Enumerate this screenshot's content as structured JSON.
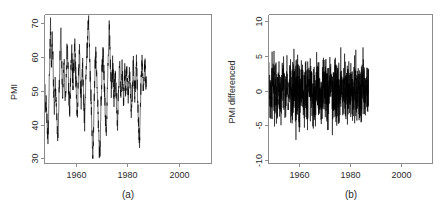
{
  "figure": {
    "background_color": "#ffffff",
    "line_color": "#000000",
    "axis_color": "#8c8c8c",
    "panels": [
      {
        "id": "a",
        "caption": "(a)",
        "ylabel": "PMI",
        "xlabel": ""
      },
      {
        "id": "b",
        "caption": "(b)",
        "ylabel": "PMI differenced",
        "xlabel": ""
      }
    ]
  },
  "chart_data": [
    {
      "type": "line",
      "panel": "a",
      "title": "",
      "caption": "(a)",
      "xlabel": "",
      "ylabel": "PMI",
      "xlim": [
        1948.0,
        2012.5
      ],
      "ylim": [
        28.5,
        72.5
      ],
      "xticks": [
        1960,
        1980,
        2000
      ],
      "xticklabels": [
        "1960",
        "1980",
        "2000"
      ],
      "yticks": [
        30,
        40,
        50,
        60,
        70
      ],
      "yticklabels": [
        "30",
        "40",
        "50",
        "60",
        "70"
      ],
      "grid": false,
      "legend": false,
      "series": [
        {
          "name": "PMI",
          "x_start": 1948.0,
          "x_step": 0.1667,
          "values": [
            47.5,
            49.8,
            46.2,
            44.9,
            48.1,
            43.0,
            41.5,
            38.2,
            35.6,
            40.4,
            46.9,
            52.7,
            58.1,
            63.4,
            68.9,
            64.2,
            57.0,
            61.1,
            66.3,
            62.4,
            55.8,
            50.2,
            46.7,
            44.1,
            48.6,
            53.0,
            49.2,
            45.5,
            43.8,
            41.2,
            38.9,
            34.7,
            38.0,
            44.2,
            50.1,
            55.6,
            60.3,
            65.1,
            67.4,
            62.0,
            57.6,
            53.1,
            49.4,
            52.3,
            56.8,
            59.9,
            54.7,
            50.0,
            46.4,
            49.1,
            53.5,
            57.2,
            61.0,
            63.8,
            60.1,
            55.2,
            51.6,
            48.0,
            44.3,
            47.0,
            51.2,
            55.9,
            59.3,
            62.7,
            58.4,
            54.0,
            50.5,
            53.8,
            57.1,
            60.5,
            63.9,
            61.2,
            56.4,
            52.0,
            48.7,
            45.0,
            42.1,
            46.3,
            51.0,
            55.7,
            58.9,
            61.4,
            57.0,
            52.6,
            49.2,
            46.8,
            50.1,
            54.5,
            58.0,
            55.3,
            51.0,
            47.2,
            43.6,
            39.8,
            44.5,
            49.9,
            54.2,
            57.6,
            60.1,
            62.4,
            65.8,
            69.2,
            71.8,
            67.0,
            62.2,
            58.5,
            54.0,
            50.3,
            46.9,
            42.7,
            38.0,
            33.1,
            30.6,
            35.4,
            41.0,
            46.8,
            52.1,
            56.7,
            59.2,
            61.5,
            58.0,
            54.3,
            51.0,
            47.5,
            44.2,
            40.0,
            36.5,
            32.8,
            29.8,
            34.6,
            40.2,
            45.9,
            50.4,
            54.8,
            57.2,
            59.6,
            62.0,
            58.3,
            54.0,
            50.6,
            47.0,
            43.2,
            39.5,
            36.0,
            40.8,
            46.5,
            52.0,
            57.4,
            62.1,
            66.0,
            69.8,
            65.2,
            60.4,
            56.0,
            52.4,
            49.0,
            51.8,
            55.3,
            58.0,
            54.6,
            51.2,
            48.0,
            50.5,
            53.9,
            56.2,
            52.8,
            49.4,
            46.0,
            42.5,
            39.2,
            43.8,
            48.6,
            52.0,
            55.4,
            57.8,
            54.2,
            50.8,
            47.6,
            51.0,
            54.4,
            56.9,
            53.5,
            50.1,
            47.0,
            49.8,
            53.2,
            55.6,
            52.2,
            48.8,
            51.4,
            54.8,
            57.0,
            53.6,
            50.2,
            47.8,
            51.2,
            54.6,
            56.0,
            52.6,
            49.2,
            46.0,
            42.8,
            45.4,
            49.0,
            52.4,
            55.8,
            58.2,
            54.8,
            51.4,
            48.0,
            50.6,
            53.0,
            55.4,
            57.8,
            54.4,
            51.0,
            47.6,
            44.2,
            40.8,
            37.5,
            33.0,
            38.2,
            44.0,
            49.5,
            53.8,
            57.0,
            59.4,
            56.0,
            52.6,
            49.2,
            51.8,
            54.2,
            56.6,
            58.0,
            54.6,
            51.2,
            53.8
          ]
        }
      ]
    },
    {
      "type": "line",
      "panel": "b",
      "title": "",
      "caption": "(b)",
      "xlabel": "",
      "ylabel": "PMI differenced",
      "xlim": [
        1948.0,
        2012.5
      ],
      "ylim": [
        -10.5,
        11.0
      ],
      "xticks": [
        1960,
        1980,
        2000
      ],
      "xticklabels": [
        "1960",
        "1980",
        "2000"
      ],
      "yticks": [
        -10,
        -5,
        0,
        5,
        10
      ],
      "yticklabels": [
        "-10",
        "-5",
        "0",
        "5",
        "10"
      ],
      "grid": false,
      "legend": false,
      "series": [
        {
          "name": "PMI differenced",
          "x_start": 1948.1,
          "x_step": 0.1667,
          "note": "first difference of the PMI level series; spikes near 1960 (-9.5), 1981 (+10.6), 1984 (+8.8), 1982 (-8.2)"
        }
      ]
    }
  ]
}
